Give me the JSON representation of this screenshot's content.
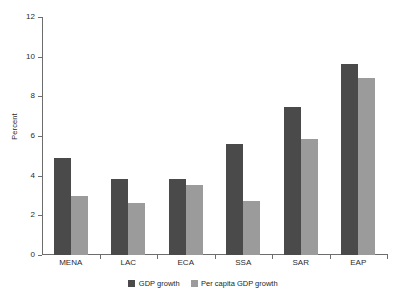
{
  "chart_data": {
    "type": "bar",
    "title": "",
    "xlabel": "",
    "ylabel": "Percent",
    "ylim": [
      0,
      12
    ],
    "ytick_step": 2,
    "yticks": [
      0,
      2,
      4,
      6,
      8,
      10,
      12
    ],
    "ytick_labels": [
      "0",
      "2",
      "4",
      "6",
      "8",
      "10",
      "12"
    ],
    "grid": false,
    "legend_position": "bottom-center",
    "categories": [
      "MENA",
      "LAC",
      "ECA",
      "SSA",
      "SAR",
      "EAP"
    ],
    "series": [
      {
        "name": "GDP growth",
        "color": "#4a4a4a",
        "values": [
          4.9,
          3.85,
          3.85,
          5.6,
          7.45,
          9.65
        ]
      },
      {
        "name": "Per capita GDP growth",
        "color": "#9b9b9b",
        "values": [
          3.0,
          2.6,
          3.55,
          2.7,
          5.85,
          8.9
        ]
      }
    ]
  },
  "legend": {
    "items": [
      {
        "label": "GDP growth",
        "color": "#4a4a4a"
      },
      {
        "label": "Per capita GDP growth",
        "color": "#9b9b9b"
      }
    ]
  },
  "axis": {
    "y_title": "Percent"
  }
}
